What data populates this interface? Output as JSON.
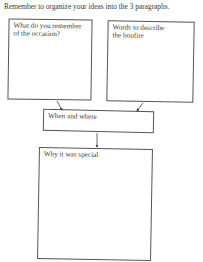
{
  "worksheet": {
    "instruction": "Remember to organize your ideas into the 3 paragraphs.",
    "boxes": [
      {
        "id": "remember",
        "label_line1": "What do you remember",
        "label_line2": "of the occasion?"
      },
      {
        "id": "describe",
        "label_line1": "Words to describe",
        "label_line2": "the bonfire"
      },
      {
        "id": "when-where",
        "label_line1": "When and where"
      },
      {
        "id": "special",
        "label_line1": "Why it was special"
      }
    ]
  }
}
